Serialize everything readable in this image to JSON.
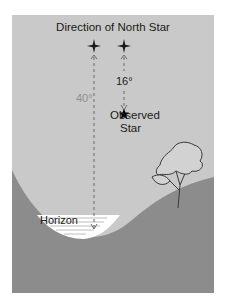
{
  "diagram": {
    "title": "Direction of North Star",
    "angle_small": "16°",
    "angle_large": "40°",
    "observed_line1": "Observed",
    "observed_line2": "Star",
    "horizon_label": "Horizon",
    "colors": {
      "sky": "#c9c9c9",
      "ground": "#8c8c8c",
      "water": "#ffffff",
      "text": "#1a1a1a",
      "angle_large_text": "#8e8e8e",
      "dashed_line": "#6a6a6a"
    }
  }
}
